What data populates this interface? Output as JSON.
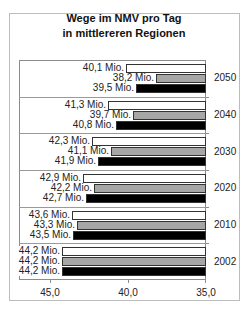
{
  "title_line1": "Wege im NMV pro Tag",
  "title_line2": "in mittlereren Regionen",
  "colors": {
    "series1": "#ffffff",
    "series2": "#a6a6a6",
    "series3": "#000000"
  },
  "x_ticks": [
    "45,0",
    "40,0",
    "35,0"
  ],
  "groups": [
    {
      "year": "2050",
      "labels": [
        "40,1 Mio.",
        "38,2 Mio.",
        "39,5 Mio."
      ]
    },
    {
      "year": "2040",
      "labels": [
        "41,3 Mio.",
        "39,7 Mio.",
        "40,8 Mio."
      ]
    },
    {
      "year": "2030",
      "labels": [
        "42,3 Mio.",
        "41,1 Mio.",
        "41,9 Mio."
      ]
    },
    {
      "year": "2020",
      "labels": [
        "42,9 Mio.",
        "42,2 Mio.",
        "42,7 Mio."
      ]
    },
    {
      "year": "2010",
      "labels": [
        "43,6 Mio.",
        "43,3 Mio.",
        "43,5 Mio."
      ]
    },
    {
      "year": "2002",
      "labels": [
        "44,2 Mio.",
        "44,2 Mio.",
        "44,2 Mio."
      ]
    }
  ],
  "chart_data": {
    "type": "bar",
    "orientation": "horizontal",
    "title": "Wege im NMV pro Tag in mittlereren Regionen",
    "categories": [
      "2050",
      "2040",
      "2030",
      "2020",
      "2010",
      "2002"
    ],
    "series": [
      {
        "name": "Series 1 (white)",
        "color": "#ffffff",
        "values": [
          40.1,
          41.3,
          42.3,
          42.9,
          43.6,
          44.2
        ]
      },
      {
        "name": "Series 2 (gray)",
        "color": "#a6a6a6",
        "values": [
          38.2,
          39.7,
          41.1,
          42.2,
          43.3,
          44.2
        ]
      },
      {
        "name": "Series 3 (black)",
        "color": "#000000",
        "values": [
          39.5,
          40.8,
          41.9,
          42.7,
          43.5,
          44.2
        ]
      }
    ],
    "unit": "Mio.",
    "xlabel": "",
    "ylabel": "",
    "xlim": [
      45.0,
      35.0
    ],
    "x_reversed": true,
    "x_ticks": [
      45.0,
      40.0,
      35.0
    ],
    "grid": false,
    "legend": "none",
    "data_labels": true
  }
}
